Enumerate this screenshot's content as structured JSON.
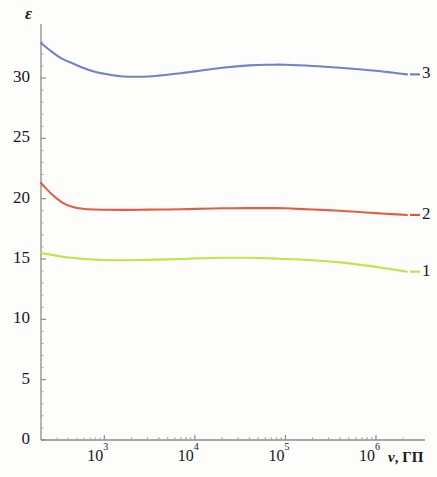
{
  "figure": {
    "axis_label_y": "ε",
    "axis_label_x_symbol": "ν",
    "axis_label_x_units": ", ГП"
  },
  "y_ticks": [
    {
      "label": "30",
      "value": 30
    },
    {
      "label": "25",
      "value": 25
    },
    {
      "label": "20",
      "value": 20
    },
    {
      "label": "15",
      "value": 15
    },
    {
      "label": "10",
      "value": 10
    },
    {
      "label": "5",
      "value": 5
    },
    {
      "label": "0",
      "value": 0
    }
  ],
  "x_ticks": [
    {
      "mantissa": "10",
      "exponent": "3",
      "value": 1000
    },
    {
      "mantissa": "10",
      "exponent": "4",
      "value": 10000
    },
    {
      "mantissa": "10",
      "exponent": "5",
      "value": 100000
    },
    {
      "mantissa": "10",
      "exponent": "6",
      "value": 1000000
    }
  ],
  "curve_labels": [
    {
      "label": "3",
      "color": "#6d79c4"
    },
    {
      "label": "2",
      "color": "#e0543a"
    },
    {
      "label": "1",
      "color": "#b9e63f"
    }
  ],
  "chart_data": {
    "type": "line",
    "title": "",
    "xlabel": "ν, ГП",
    "ylabel": "ε",
    "xscale": "log",
    "yscale": "linear",
    "xlim": [
      200,
      2500000
    ],
    "ylim": [
      0,
      33.5
    ],
    "grid": false,
    "legend": "curve numbers at right end of each line",
    "x": [
      200,
      260,
      340,
      450,
      600,
      800,
      1000,
      1500,
      2500,
      4000,
      7000,
      10000,
      20000,
      40000,
      70000,
      100000,
      200000,
      400000,
      700000,
      1000000,
      1500000,
      2200000
    ],
    "series": [
      {
        "name": "3",
        "label": "3",
        "color": "#6d79c4",
        "values": [
          32.9,
          32.2,
          31.6,
          31.2,
          30.8,
          30.5,
          30.35,
          30.15,
          30.1,
          30.2,
          30.4,
          30.55,
          30.85,
          31.05,
          31.1,
          31.1,
          31.0,
          30.85,
          30.7,
          30.6,
          30.45,
          30.3
        ]
      },
      {
        "name": "2",
        "label": "2",
        "color": "#e0543a",
        "values": [
          21.3,
          20.4,
          19.7,
          19.3,
          19.15,
          19.1,
          19.08,
          19.07,
          19.08,
          19.1,
          19.12,
          19.15,
          19.2,
          19.22,
          19.22,
          19.2,
          19.1,
          19.0,
          18.88,
          18.8,
          18.72,
          18.65
        ]
      },
      {
        "name": "1",
        "label": "1",
        "color": "#b9e63f",
        "values": [
          15.5,
          15.35,
          15.2,
          15.1,
          15.0,
          14.95,
          14.92,
          14.9,
          14.92,
          14.95,
          15.0,
          15.05,
          15.1,
          15.1,
          15.05,
          15.0,
          14.9,
          14.72,
          14.5,
          14.35,
          14.15,
          13.95
        ]
      }
    ]
  }
}
